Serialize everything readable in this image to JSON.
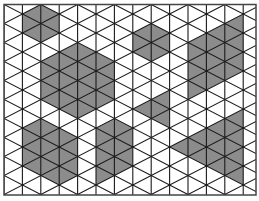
{
  "colors": {
    "background": "#ffffff",
    "line": "#1a1a1a",
    "border": "#444444",
    "fill": "#8c8c8c"
  },
  "grid": {
    "left": 4,
    "top": 4.5,
    "right": 256,
    "bottom": 195,
    "column_spacing": 18.4,
    "columns": 14,
    "vertex_spacing": 19,
    "rows": 10
  },
  "shaded_regions": [
    {
      "name": "small-hexagon-top-left",
      "points": [
        [
          22.4,
          14
        ],
        [
          40.8,
          4.5
        ],
        [
          59.2,
          14
        ],
        [
          59.2,
          33
        ],
        [
          40.8,
          42.5
        ],
        [
          22.4,
          33
        ]
      ]
    },
    {
      "name": "large-hexagon-center-left",
      "points": [
        [
          40.8,
          61.5
        ],
        [
          77.6,
          42.5
        ],
        [
          114.4,
          61.5
        ],
        [
          114.4,
          99.5
        ],
        [
          77.6,
          118.5
        ],
        [
          40.8,
          99.5
        ]
      ]
    },
    {
      "name": "hexagon-top-middle",
      "points": [
        [
          132.8,
          33
        ],
        [
          151.2,
          23.5
        ],
        [
          169.6,
          33
        ],
        [
          169.6,
          52
        ],
        [
          151.2,
          61.5
        ],
        [
          132.8,
          52
        ]
      ]
    },
    {
      "name": "parallelogram-top-right",
      "points": [
        [
          188,
          42.5
        ],
        [
          243.2,
          14
        ],
        [
          243.2,
          71
        ],
        [
          188,
          99.5
        ]
      ]
    },
    {
      "name": "quad-middle",
      "points": [
        [
          132.8,
          109
        ],
        [
          169.6,
          90
        ],
        [
          169.6,
          128
        ],
        [
          151.2,
          118.5
        ]
      ]
    },
    {
      "name": "shape-bottom-left",
      "points": [
        [
          22.4,
          128
        ],
        [
          40.8,
          118.5
        ],
        [
          59.2,
          128
        ],
        [
          77.6,
          137.5
        ],
        [
          77.6,
          175.5
        ],
        [
          59.2,
          185
        ],
        [
          40.8,
          175.5
        ],
        [
          22.4,
          166
        ]
      ]
    },
    {
      "name": "shape-bottom-middle",
      "points": [
        [
          96,
          128
        ],
        [
          114.4,
          118.5
        ],
        [
          132.8,
          128
        ],
        [
          132.8,
          166
        ],
        [
          114.4,
          175.5
        ],
        [
          96,
          185
        ]
      ]
    },
    {
      "name": "triangle-bottom-right",
      "points": [
        [
          169.6,
          147
        ],
        [
          243.2,
          109
        ],
        [
          243.2,
          185
        ]
      ]
    }
  ]
}
